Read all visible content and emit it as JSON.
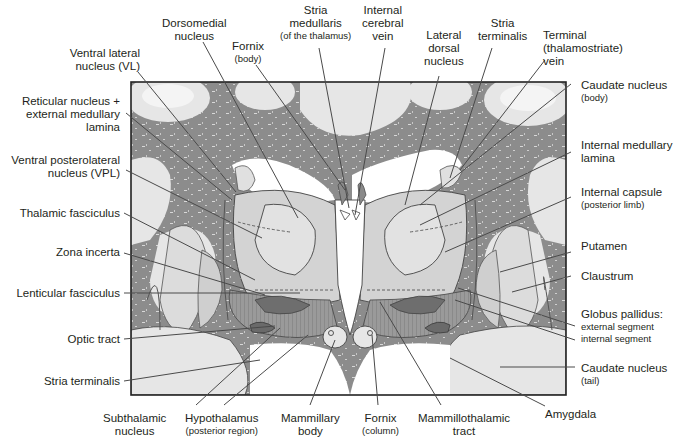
{
  "figure": {
    "colors": {
      "white_matter": "#8a8a8a",
      "gray_matter": "#e4e4e4",
      "thalamus_fill": "#d2d2d2",
      "ventricle": "#ffffff",
      "fasciculus": "#7a7a7a",
      "frame": "#222222",
      "leader": "#4a4a4a"
    }
  },
  "labels": {
    "top": [
      {
        "id": "dorsomedial",
        "text": "Dorsomedial",
        "line2": "nucleus"
      },
      {
        "id": "fornix_body",
        "text": "Fornix",
        "sub": "(body)"
      },
      {
        "id": "stria_medullaris",
        "text": "Stria",
        "line2": "medullaris",
        "sub": "(of the thalamus)"
      },
      {
        "id": "internal_cerebral_vein",
        "text": "Internal",
        "line2": "cerebral",
        "line3": "vein"
      },
      {
        "id": "lateral_dorsal",
        "text": "Lateral",
        "line2": "dorsal",
        "line3": "nucleus"
      },
      {
        "id": "stria_terminalis_top",
        "text": "Stria",
        "line2": "terminalis"
      },
      {
        "id": "terminal_vein",
        "text": "Terminal",
        "line2": "(thalamostriate)",
        "line3": "vein"
      }
    ],
    "left": [
      {
        "id": "ventral_lateral",
        "text": "Ventral lateral",
        "line2": "nucleus (VL)"
      },
      {
        "id": "reticular",
        "text": "Reticular nucleus +",
        "line2": "external medullary",
        "line3": "lamina"
      },
      {
        "id": "vpl",
        "text": "Ventral posterolateral",
        "line2": "nucleus (VPL)"
      },
      {
        "id": "thalamic_fasciculus",
        "text": "Thalamic fasciculus"
      },
      {
        "id": "zona_incerta",
        "text": "Zona incerta"
      },
      {
        "id": "lenticular_fasciculus",
        "text": "Lenticular fasciculus"
      },
      {
        "id": "optic_tract",
        "text": "Optic tract"
      },
      {
        "id": "stria_terminalis_left",
        "text": "Stria terminalis"
      }
    ],
    "right": [
      {
        "id": "caudate_body",
        "text": "Caudate nucleus",
        "sub": "(body)"
      },
      {
        "id": "internal_medullary",
        "text": "Internal medullary",
        "line2": "lamina"
      },
      {
        "id": "internal_capsule",
        "text": "Internal capsule",
        "sub": "(posterior limb)"
      },
      {
        "id": "putamen",
        "text": "Putamen"
      },
      {
        "id": "claustrum",
        "text": "Claustrum"
      },
      {
        "id": "globus_pallidus",
        "text": "Globus pallidus:",
        "sub1": "external segment",
        "sub2": "internal segment"
      },
      {
        "id": "caudate_tail",
        "text": "Caudate nucleus",
        "sub": "(tail)"
      },
      {
        "id": "amygdala",
        "text": "Amygdala"
      }
    ],
    "bottom": [
      {
        "id": "subthalamic",
        "text": "Subthalamic",
        "line2": "nucleus"
      },
      {
        "id": "hypothalamus",
        "text": "Hypothalamus",
        "sub": "(posterior region)"
      },
      {
        "id": "mammillary_body",
        "text": "Mammillary",
        "line2": "body"
      },
      {
        "id": "fornix_column",
        "text": "Fornix",
        "sub": "(column)"
      },
      {
        "id": "mammillothalamic",
        "text": "Mammillothalamic",
        "line2": "tract"
      }
    ]
  }
}
